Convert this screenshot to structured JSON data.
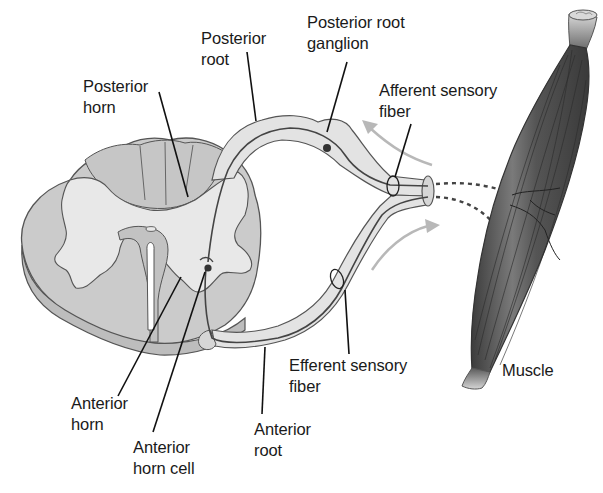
{
  "figure": {
    "colors": {
      "background": "#ffffff",
      "white_matter": "#c9c9c9",
      "gray_matter": "#e6e6e6",
      "outline": "#555555",
      "nerve_fill": "#e4e4e4",
      "muscle_dark": "#4a4a4a",
      "muscle_light": "#8a8a8a",
      "arrow": "#b5b5b5",
      "label_text": "#1a1a1a",
      "leader_line": "#111111"
    }
  },
  "labels": {
    "posterior_horn": "Posterior\nhorn",
    "posterior_root": "Posterior\nroot",
    "posterior_root_ganglion": "Posterior root\nganglion",
    "afferent_sensory_fiber": "Afferent sensory\nfiber",
    "efferent_sensory_fiber": "Efferent sensory\nfiber",
    "anterior_horn": "Anterior\nhorn",
    "anterior_horn_cell": "Anterior\nhorn cell",
    "anterior_root": "Anterior\nroot",
    "muscle": "Muscle"
  }
}
